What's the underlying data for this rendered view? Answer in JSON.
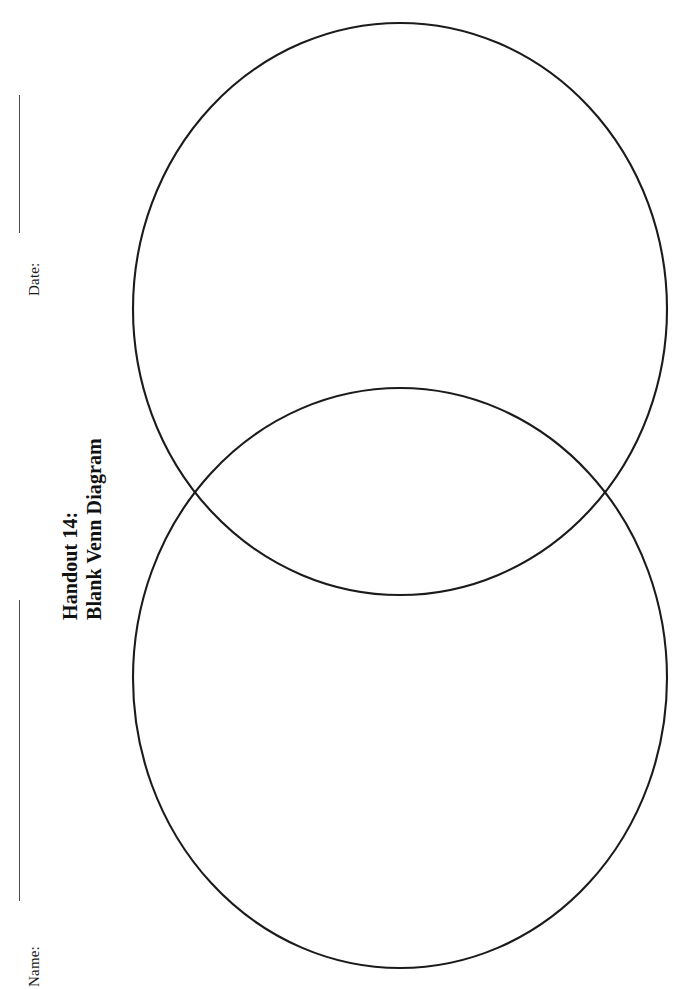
{
  "page": {
    "background_color": "#ffffff",
    "width": 680,
    "height": 990
  },
  "header_fields": [
    {
      "name": "date",
      "label": "Date:",
      "rule": {
        "orientation": "vertical",
        "color": "#4a4a4a"
      }
    },
    {
      "name": "name",
      "label": "Name:",
      "rule": {
        "orientation": "vertical",
        "color": "#4a4a4a"
      }
    }
  ],
  "title": {
    "line1": "Handout 14:",
    "line2": "Blank Venn Diagram",
    "rotation": "-90deg",
    "color": "#111111"
  },
  "diagram": {
    "type": "venn",
    "set_count": 2,
    "stroke_color": "#1b1b1b",
    "fill": "none",
    "stroke_width": 2.1,
    "circles": [
      {
        "id": "top-circle",
        "cx": 400,
        "cy": 309,
        "rx": 267,
        "ry": 286
      },
      {
        "id": "bottom-circle",
        "cx": 400,
        "cy": 678,
        "rx": 267,
        "ry": 290
      }
    ],
    "intersections": [
      {
        "x": 193,
        "y": 492
      },
      {
        "x": 605,
        "y": 492
      }
    ],
    "labels": []
  }
}
